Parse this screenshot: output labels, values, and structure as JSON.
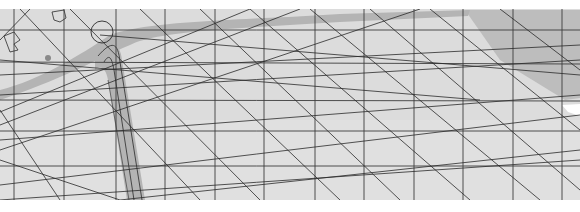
{
  "image": {
    "description": "Scanned grayscale architectural site-plan drawing with a rectilinear grid, diagonal construction lines and a curved road",
    "width": 580,
    "height": 212
  },
  "colors": {
    "paper": "#dcdcdc",
    "paper_light": "#e6e6e6",
    "road_fill": "#b4b4b4",
    "shade_fill": "#bdbdbd",
    "line": "#2a2a2a",
    "grid_line": "#3c3c3c",
    "border": "#ffffff"
  },
  "grid": {
    "vertical_x": [
      14,
      64,
      116,
      165,
      215,
      264,
      315,
      364,
      414,
      463,
      513,
      562
    ],
    "horizontal_y": [
      30,
      62,
      95,
      131,
      166,
      200
    ]
  }
}
